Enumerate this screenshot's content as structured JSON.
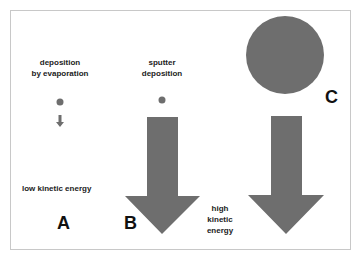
{
  "labels": {
    "evaporation": "deposition\nby evaporation",
    "sputter": "sputter\ndeposition",
    "low_energy": "low kinetic energy",
    "high_energy": "high\nkinetic\nenergy"
  },
  "panels": [
    {
      "letter": "A",
      "particle": "small dot",
      "arrow": "small arrow"
    },
    {
      "letter": "B",
      "particle": "small dot",
      "arrow": "large arrow"
    },
    {
      "letter": "C",
      "particle": "large circle",
      "arrow": "large arrow"
    }
  ],
  "colors": {
    "fill": "#6e6e6e",
    "frame": "#c8c8c8",
    "text": "#222222"
  }
}
